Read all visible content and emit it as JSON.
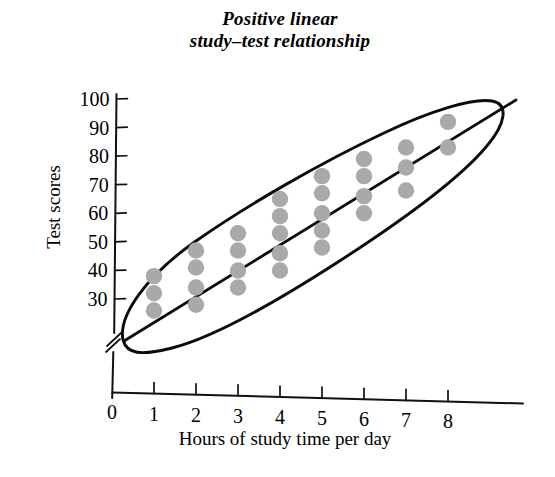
{
  "chart_data": {
    "type": "scatter",
    "title": "Positive linear study–test relationship",
    "title_line1": "Positive linear",
    "title_line2": "study–test relationship",
    "xlabel": "Hours of study time per day",
    "ylabel": "Test scores",
    "xlim": [
      0,
      9
    ],
    "ylim": [
      22,
      102
    ],
    "xticks": [
      0,
      1,
      2,
      3,
      4,
      5,
      6,
      7,
      8
    ],
    "xtick_labels": [
      "0",
      "1",
      "2",
      "3",
      "4",
      "5",
      "6",
      "7",
      "8"
    ],
    "yticks": [
      30,
      40,
      50,
      60,
      70,
      80,
      90,
      100
    ],
    "ytick_labels": [
      "30",
      "40",
      "50",
      "60",
      "70",
      "80",
      "90",
      "100"
    ],
    "grid": false,
    "legend": null,
    "y_axis_break": true,
    "marker_color": "#a9a9a9",
    "marker_shape": "circle",
    "line_color": "#0b0b0b",
    "annotations": [
      {
        "name": "trend-line",
        "description": "straight positive sloping regression line through the cloud"
      },
      {
        "name": "envelope-ellipse",
        "description": "hand-drawn narrow ellipse enclosing all data points"
      }
    ],
    "x": [
      1,
      1,
      1,
      2,
      2,
      2,
      2,
      3,
      3,
      3,
      3,
      4,
      4,
      4,
      4,
      4,
      5,
      5,
      5,
      5,
      5,
      6,
      6,
      6,
      6,
      7,
      7,
      7,
      8,
      8
    ],
    "y": [
      38,
      32,
      26,
      47,
      41,
      34,
      28,
      53,
      47,
      40,
      34,
      65,
      59,
      53,
      46,
      40,
      73,
      67,
      60,
      54,
      48,
      79,
      73,
      66,
      60,
      83,
      76,
      68,
      92,
      83
    ],
    "points": [
      {
        "x": 1,
        "y": 38
      },
      {
        "x": 1,
        "y": 32
      },
      {
        "x": 1,
        "y": 26
      },
      {
        "x": 2,
        "y": 47
      },
      {
        "x": 2,
        "y": 41
      },
      {
        "x": 2,
        "y": 34
      },
      {
        "x": 2,
        "y": 28
      },
      {
        "x": 3,
        "y": 53
      },
      {
        "x": 3,
        "y": 47
      },
      {
        "x": 3,
        "y": 40
      },
      {
        "x": 3,
        "y": 34
      },
      {
        "x": 4,
        "y": 65
      },
      {
        "x": 4,
        "y": 59
      },
      {
        "x": 4,
        "y": 53
      },
      {
        "x": 4,
        "y": 46
      },
      {
        "x": 4,
        "y": 40
      },
      {
        "x": 5,
        "y": 73
      },
      {
        "x": 5,
        "y": 67
      },
      {
        "x": 5,
        "y": 60
      },
      {
        "x": 5,
        "y": 54
      },
      {
        "x": 5,
        "y": 48
      },
      {
        "x": 6,
        "y": 79
      },
      {
        "x": 6,
        "y": 73
      },
      {
        "x": 6,
        "y": 66
      },
      {
        "x": 6,
        "y": 60
      },
      {
        "x": 7,
        "y": 83
      },
      {
        "x": 7,
        "y": 76
      },
      {
        "x": 7,
        "y": 68
      },
      {
        "x": 8,
        "y": 92
      },
      {
        "x": 8,
        "y": 83
      }
    ],
    "trend": {
      "x_start": 0.7,
      "y_start": 24,
      "x_end": 8.7,
      "y_end": 99
    }
  }
}
